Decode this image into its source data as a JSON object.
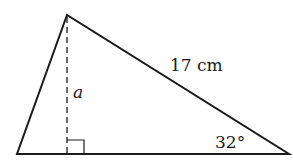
{
  "diagram": {
    "type": "triangle",
    "labels": {
      "hypotenuse_side": "17 cm",
      "altitude": "a",
      "angle": "32°"
    },
    "colors": {
      "stroke": "#1a1a1a",
      "background": "#ffffff"
    },
    "right_angle_marker": true
  }
}
